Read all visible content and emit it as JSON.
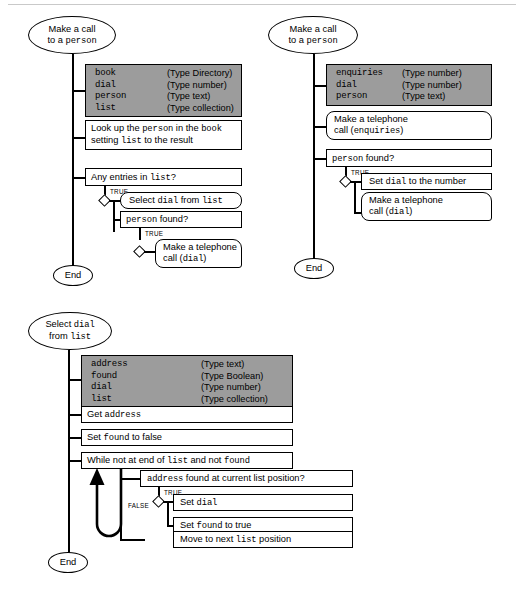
{
  "page": {
    "background": "#ffffff",
    "shade_color": "#9c9c9c",
    "line_color": "#000000"
  },
  "diagrams": [
    {
      "id": "diagram-top-left",
      "start_label_line1": "Make a call",
      "start_label_line2_pre": "to a ",
      "start_label_line2_mono": "person",
      "end_label": "End",
      "declarations": [
        {
          "name": "book",
          "type": "(Type Directory)"
        },
        {
          "name": "dial",
          "type": "(Type number)"
        },
        {
          "name": "person",
          "type": "(Type text)"
        },
        {
          "name": "list",
          "type": "(Type collection)"
        }
      ],
      "steps": {
        "lookup_line1_a": "Look up the ",
        "lookup_line1_b": "person",
        "lookup_line1_c": " in the ",
        "lookup_line1_d": "book",
        "lookup_line2_a": "setting ",
        "lookup_line2_b": "list",
        "lookup_line2_c": " to the result",
        "condition1_a": "Any entries in ",
        "condition1_b": "list",
        "condition1_c": "?",
        "branch1_label": "TRUE",
        "select_a": "Select ",
        "select_b": "dial",
        "select_c": " from ",
        "select_d": "list",
        "condition2_a": "person",
        "condition2_b": " found?",
        "branch2_label": "TRUE",
        "call_line1": "Make a telephone",
        "call_line2_a": "call (",
        "call_line2_b": "dial",
        "call_line2_c": ")"
      }
    },
    {
      "id": "diagram-top-right",
      "start_label_line1": "Make a call",
      "start_label_line2_pre": "to a ",
      "start_label_line2_mono": "person",
      "end_label": "End",
      "declarations": [
        {
          "name": "enquiries",
          "type": "(Type number)"
        },
        {
          "name": "dial",
          "type": "(Type number)"
        },
        {
          "name": "person",
          "type": "(Type text)"
        }
      ],
      "steps": {
        "call_enq_line1": "Make a telephone",
        "call_enq_line2_a": "call (",
        "call_enq_line2_b": "enquiries",
        "call_enq_line2_c": ")",
        "condition1_a": "person",
        "condition1_b": " found?",
        "branch1_label": "TRUE",
        "setdial_a": "Set ",
        "setdial_b": "dial",
        "setdial_c": " to the number",
        "call_dial_line1": "Make a telephone",
        "call_dial_line2_a": "call (",
        "call_dial_line2_b": "dial",
        "call_dial_line2_c": ")"
      }
    },
    {
      "id": "diagram-bottom",
      "start_label_line1_pre": "Select ",
      "start_label_line1_mono": "dial",
      "start_label_line2_pre": "from ",
      "start_label_line2_mono": "list",
      "end_label": "End",
      "declarations": [
        {
          "name": "address",
          "type": "(Type text)"
        },
        {
          "name": "found",
          "type": "(Type Boolean)"
        },
        {
          "name": "dial",
          "type": "(Type number)"
        },
        {
          "name": "list",
          "type": "(Type collection)"
        }
      ],
      "steps": {
        "get_address_a": "Get ",
        "get_address_b": "address",
        "set_found_false_a": "Set ",
        "set_found_false_b": "found",
        "set_found_false_c": " to false",
        "while_a": "While not at end of ",
        "while_b": "list",
        "while_c": " and not ",
        "while_d": "found",
        "condition_a": "address",
        "condition_b": " found at current list position?",
        "branch_true_label": "TRUE",
        "branch_false_label": "FALSE",
        "set_dial_a": "Set ",
        "set_dial_b": "dial",
        "set_found_true_a": "Set ",
        "set_found_true_b": "found",
        "set_found_true_c": " to true",
        "move_next_a": "Move to next ",
        "move_next_b": "list",
        "move_next_c": " position"
      }
    }
  ]
}
